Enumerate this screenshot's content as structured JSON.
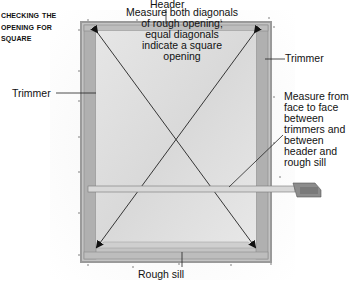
{
  "title": {
    "lines": [
      "Checking the",
      "Opening for",
      "Square"
    ]
  },
  "labels": {
    "header": "Header",
    "trimmer_right": "Trimmer",
    "trimmer_left": "Trimmer",
    "rough_sill": "Rough sill"
  },
  "notes": {
    "diagonals": [
      "Measure both diagonals",
      "of rough opening;",
      "equal diagonals",
      "indicate a square",
      "opening"
    ],
    "face_to_face": [
      "Measure from",
      "face to face",
      "between",
      "trimmers and",
      "between",
      "header and",
      "rough sill"
    ]
  },
  "colors": {
    "frame_dark": "#8a8a8a",
    "frame_mid": "#b5b5b5",
    "frame_light": "#d4d4d4",
    "opening": "#e2e2e2",
    "line": "#333333"
  }
}
